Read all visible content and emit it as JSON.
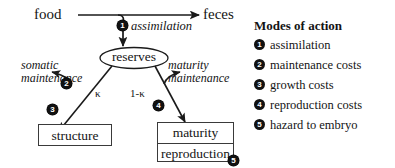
{
  "figure": {
    "nodes": {
      "food": "food",
      "feces": "feces",
      "reserves": "reserves",
      "structure": "structure",
      "maturity": "maturity",
      "reproduction": "reproduction"
    },
    "flow_labels": {
      "assimilation": "assimilation",
      "somatic_maintenance_line1": "somatic",
      "somatic_maintenance_line2": "maintenance",
      "maturity_maintenance_line1": "maturity",
      "maturity_maintenance_line2": "maintenance",
      "kappa": "κ",
      "one_minus_kappa": "1-κ"
    },
    "graph_badges": [
      {
        "id": "g1",
        "number": "❶",
        "glyph": "1"
      },
      {
        "id": "g2",
        "number": "❷",
        "glyph": "2"
      },
      {
        "id": "g3",
        "number": "❸",
        "glyph": "3"
      },
      {
        "id": "g4",
        "number": "❹",
        "glyph": "4"
      },
      {
        "id": "g5",
        "number": "❺",
        "glyph": "5"
      }
    ]
  },
  "legend": {
    "title": "Modes of action",
    "items": [
      {
        "marker": "1",
        "label": "assimilation"
      },
      {
        "marker": "2",
        "label": "maintenance costs"
      },
      {
        "marker": "3",
        "label": "growth costs"
      },
      {
        "marker": "4",
        "label": "reproduction costs"
      },
      {
        "marker": "5",
        "label": "hazard to embryo"
      }
    ]
  },
  "colors": {
    "ink": "#141414",
    "line": "#1a1a1a",
    "badge_fill": "#111111",
    "badge_text": "#ffffff",
    "background": "#ffffff"
  }
}
